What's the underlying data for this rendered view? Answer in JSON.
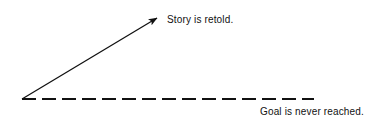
{
  "figure": {
    "title": "",
    "background_color": "#ffffff",
    "width": 377,
    "height": 121,
    "stroke_color": "#111111",
    "labels": {
      "ascending_arrow": "Story is retold.",
      "horizontal_dashed": "Goal is never reached."
    },
    "geometry": {
      "origin": {
        "x": 22,
        "y": 99
      },
      "arrow_tip": {
        "x": 162,
        "y": 14
      },
      "dashed_end": {
        "x": 314,
        "y": 99
      },
      "dash_length": 14,
      "dash_gap": 6,
      "arrow_stroke_width": 1.3,
      "dashed_stroke_width": 2.2
    }
  }
}
